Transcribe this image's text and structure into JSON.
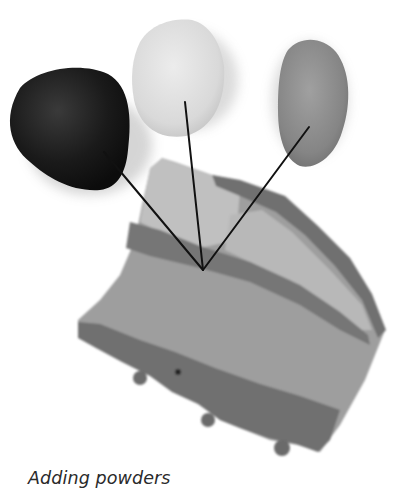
{
  "caption": "Adding powders",
  "illustration": {
    "subject": "clay slab with three powder pebbles",
    "pebbles": [
      {
        "name": "dark-pebble",
        "shade": "#1b1b1b"
      },
      {
        "name": "light-pebble",
        "shade": "#dcdcdc"
      },
      {
        "name": "mid-pebble",
        "shade": "#8a8a8a"
      }
    ],
    "pointer_target": [
      203,
      270
    ]
  }
}
